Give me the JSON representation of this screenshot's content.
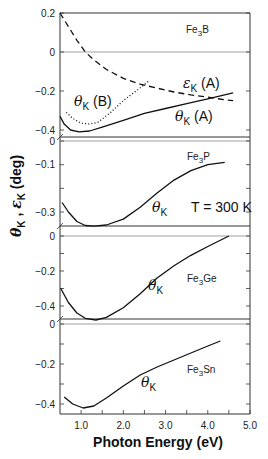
{
  "chart_data": {
    "type": "line",
    "title": "",
    "xlabel": "Photon Energy (eV)",
    "ylabel": "θK , εK (deg)",
    "xlim": [
      0.5,
      5.0
    ],
    "x_ticks": [
      1.0,
      1.5,
      2.0,
      2.5,
      3.0,
      3.5,
      4.0,
      4.5,
      5.0
    ],
    "x_tick_labels": [
      "1.0",
      "2.0",
      "3.0",
      "4.0",
      "5.0"
    ],
    "annotation": "T = 300 K",
    "grid": false,
    "legend": "inline labels",
    "panels": [
      {
        "name": "Fe3B",
        "label_main": "Fe",
        "label_sub": "3",
        "label_tail": "B",
        "ylim": [
          -0.42,
          0.2
        ],
        "y_tick_labels": [
          "0.2",
          "0",
          "-0.2",
          "-0.4"
        ],
        "y_tick_values": [
          0.2,
          0,
          -0.2,
          -0.4
        ],
        "series": [
          {
            "name": "εK (A)",
            "label": "εK (A)",
            "style": "dashed",
            "x": [
              0.5,
              0.7,
              0.9,
              1.1,
              1.3,
              1.6,
              2.0,
              2.4,
              2.8,
              3.2,
              3.6,
              4.0,
              4.4,
              4.6
            ],
            "y": [
              0.2,
              0.13,
              0.06,
              0.0,
              -0.04,
              -0.09,
              -0.135,
              -0.165,
              -0.185,
              -0.205,
              -0.22,
              -0.232,
              -0.245,
              -0.25
            ]
          },
          {
            "name": "θK (B)",
            "label": "θK (B)",
            "style": "dotted",
            "x": [
              0.65,
              0.8,
              1.0,
              1.2,
              1.4,
              1.7,
              2.0,
              2.3,
              2.6
            ],
            "y": [
              -0.31,
              -0.34,
              -0.365,
              -0.37,
              -0.36,
              -0.31,
              -0.25,
              -0.2,
              -0.15
            ]
          },
          {
            "name": "θK (A)",
            "label": "θK (A)",
            "style": "solid",
            "x": [
              0.5,
              0.6,
              0.75,
              0.95,
              1.2,
              1.5,
              2.0,
              2.5,
              3.0,
              3.5,
              4.0,
              4.3,
              4.6
            ],
            "y": [
              -0.33,
              -0.37,
              -0.4,
              -0.41,
              -0.405,
              -0.385,
              -0.35,
              -0.315,
              -0.29,
              -0.265,
              -0.24,
              -0.225,
              -0.21
            ]
          }
        ]
      },
      {
        "name": "Fe3P",
        "label_main": "Fe",
        "label_sub": "3",
        "label_tail": "P",
        "ylim": [
          -0.37,
          0.0
        ],
        "y_tick_labels": [
          "0",
          "-0.1",
          "-0.3"
        ],
        "y_tick_values": [
          0,
          -0.1,
          -0.2,
          -0.3
        ],
        "series": [
          {
            "name": "θK",
            "label": "θK",
            "style": "solid",
            "x": [
              0.55,
              0.7,
              0.9,
              1.1,
              1.3,
              1.6,
              2.0,
              2.4,
              2.8,
              3.2,
              3.6,
              4.0,
              4.4
            ],
            "y": [
              -0.26,
              -0.3,
              -0.34,
              -0.357,
              -0.36,
              -0.355,
              -0.33,
              -0.28,
              -0.22,
              -0.165,
              -0.125,
              -0.1,
              -0.09
            ]
          }
        ]
      },
      {
        "name": "Fe3Ge",
        "label_main": "Fe",
        "label_sub": "3",
        "label_tail": "Ge",
        "ylim": [
          -0.48,
          0.0
        ],
        "y_tick_labels": [
          "0",
          "-0.2",
          "-0.4"
        ],
        "y_tick_values": [
          0,
          -0.1,
          -0.2,
          -0.3,
          -0.4
        ],
        "series": [
          {
            "name": "θK",
            "label": "θK",
            "style": "solid",
            "x": [
              0.52,
              0.7,
              0.9,
              1.1,
              1.35,
              1.6,
              2.0,
              2.4,
              2.8,
              3.2,
              3.6,
              4.0,
              4.5
            ],
            "y": [
              -0.3,
              -0.38,
              -0.44,
              -0.47,
              -0.48,
              -0.465,
              -0.41,
              -0.33,
              -0.24,
              -0.17,
              -0.11,
              -0.06,
              0.0
            ]
          }
        ]
      },
      {
        "name": "Fe3Sn",
        "label_main": "Fe",
        "label_sub": "3",
        "label_tail": "Sn",
        "ylim": [
          -0.45,
          0.0
        ],
        "y_tick_labels": [
          "0",
          "-0.2",
          "-0.4"
        ],
        "y_tick_values": [
          0,
          -0.1,
          -0.2,
          -0.3,
          -0.4
        ],
        "series": [
          {
            "name": "θK",
            "label": "θK",
            "style": "solid",
            "x": [
              0.6,
              0.8,
              1.05,
              1.3,
              1.6,
              2.0,
              2.4,
              2.8,
              3.2,
              3.6,
              4.0,
              4.3
            ],
            "y": [
              -0.365,
              -0.4,
              -0.42,
              -0.41,
              -0.37,
              -0.31,
              -0.255,
              -0.215,
              -0.18,
              -0.145,
              -0.11,
              -0.085
            ]
          }
        ]
      }
    ]
  },
  "figure": {
    "x_axis_title": "Photon Energy  (eV)",
    "y_axis_title": "θK , εK  (deg)",
    "temperature": "T = 300 K"
  }
}
